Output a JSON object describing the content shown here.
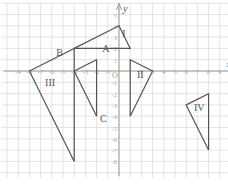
{
  "diagram": {
    "title": "",
    "x_axis_label": "x",
    "y_axis_label": "y",
    "origin_label": "O",
    "x_ticks": [
      -9,
      -8,
      -7,
      -6,
      -5,
      -4,
      -3,
      -2,
      -1,
      1,
      2,
      3,
      4,
      5,
      6,
      7,
      8,
      9
    ],
    "y_ticks": [
      5,
      4,
      3,
      2,
      1,
      -1,
      -2,
      -3,
      -4,
      -5,
      -6,
      -7,
      -8
    ],
    "grid": true,
    "colors": {
      "grid": "#d8d8d8",
      "axis": "#9a9a9a",
      "shape": "#555555",
      "label": "#555555"
    }
  },
  "shapes": [
    {
      "name": "I",
      "vertices": [
        [
          -4,
          2
        ],
        [
          0,
          4
        ],
        [
          1,
          2
        ]
      ],
      "label_pos": [
        0.3,
        3
      ]
    },
    {
      "name": "A",
      "vertices": [
        [
          -4,
          0
        ],
        [
          -2,
          1
        ],
        [
          -2,
          -4
        ]
      ],
      "label_pos": [
        -1.5,
        1.7
      ]
    },
    {
      "name": "III",
      "vertices": [
        [
          -8,
          0
        ],
        [
          -4,
          2
        ],
        [
          -4,
          -8
        ]
      ],
      "label_pos": [
        -6.6,
        -1.3
      ]
    },
    {
      "name": "II",
      "vertices": [
        [
          1,
          1
        ],
        [
          3,
          0
        ],
        [
          1,
          -4
        ]
      ],
      "label_pos": [
        1.6,
        -0.6
      ]
    },
    {
      "name": "IV",
      "vertices": [
        [
          6,
          -3
        ],
        [
          8,
          -2
        ],
        [
          8,
          -7
        ]
      ],
      "label_pos": [
        6.7,
        -3.5
      ]
    }
  ],
  "points": [
    {
      "name": "B",
      "coord": [
        -4,
        2
      ],
      "label_pos": [
        -5.6,
        1.3
      ]
    },
    {
      "name": "C",
      "coord": [
        -2,
        -4
      ],
      "label_pos": [
        -1.7,
        -4.5
      ]
    }
  ]
}
